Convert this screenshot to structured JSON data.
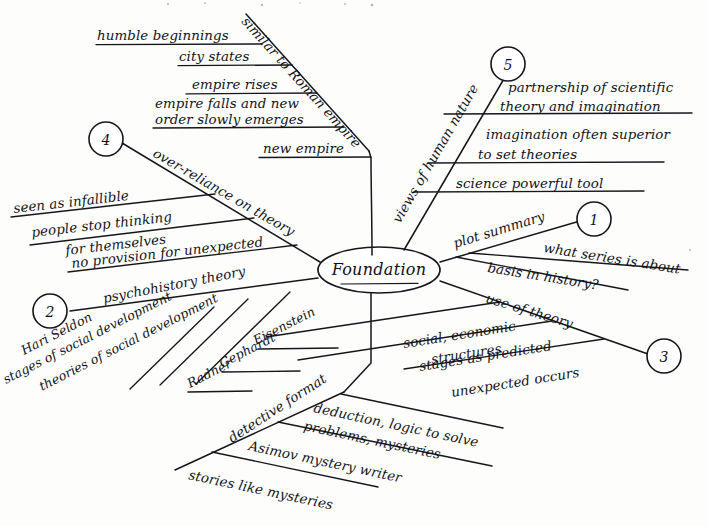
{
  "diagram": {
    "type": "mind-map",
    "title": "Foundation",
    "style": "hand-drawn cursive, black ink on white paper",
    "center": {
      "label": "Foundation",
      "shape": "ellipse"
    },
    "branch_count": 6,
    "numbered_markers": [
      "1",
      "2",
      "3",
      "4",
      "5"
    ],
    "colors": {
      "ink": "#15161a",
      "paper": "#fdfdfc"
    },
    "branches": [
      {
        "id": "roman-empire",
        "number": "",
        "label": "similar to Roman empire",
        "position": "top",
        "children": [
          {
            "lines": [
              "humble beginnings"
            ]
          },
          {
            "lines": [
              "city states"
            ]
          },
          {
            "lines": [
              "empire rises"
            ]
          },
          {
            "lines": [
              "empire falls and new",
              "order slowly emerges"
            ]
          },
          {
            "lines": [
              "new empire"
            ]
          }
        ]
      },
      {
        "id": "over-reliance-on-theory",
        "number": "4",
        "label": "over-reliance on theory",
        "position": "upper-left",
        "children": [
          {
            "lines": [
              "seen as infallible"
            ]
          },
          {
            "lines": [
              "people stop thinking",
              "for themselves"
            ]
          },
          {
            "lines": [
              "no provision for unexpected"
            ]
          }
        ]
      },
      {
        "id": "psychohistory-theory",
        "number": "2",
        "label": "psychohistory theory",
        "position": "lower-left",
        "children": [
          {
            "lines": [
              "Hari Seldon"
            ]
          },
          {
            "lines": [
              "stages of social development"
            ]
          },
          {
            "lines": [
              "theories of social development"
            ]
          },
          {
            "lines": [
              "Eisenstein"
            ]
          },
          {
            "lines": [
              "Gephardt"
            ]
          },
          {
            "lines": [
              "Radner"
            ]
          }
        ]
      },
      {
        "id": "detective-format",
        "number": "",
        "label": "detective format",
        "position": "bottom",
        "children": [
          {
            "lines": [
              "deduction, logic to solve",
              "problems, mysteries"
            ]
          },
          {
            "lines": [
              "Asimov mystery writer"
            ]
          },
          {
            "lines": [
              "stories like mysteries"
            ]
          }
        ]
      },
      {
        "id": "use-of-theory",
        "number": "3",
        "label": "use of theory",
        "position": "lower-right",
        "children": [
          {
            "lines": [
              "social, economic",
              "structures"
            ]
          },
          {
            "lines": [
              "stages as predicted"
            ]
          },
          {
            "lines": [
              "unexpected occurs"
            ]
          }
        ]
      },
      {
        "id": "plot-summary",
        "number": "1",
        "label": "plot summary",
        "position": "right",
        "children": [
          {
            "lines": [
              "what series is about"
            ]
          },
          {
            "lines": [
              "basis in history?"
            ]
          }
        ]
      },
      {
        "id": "views-of-human-nature",
        "number": "5",
        "label": "views of human nature",
        "position": "upper-right",
        "children": [
          {
            "lines": [
              "partnership of scientific",
              "theory and imagination"
            ]
          },
          {
            "lines": [
              "imagination often superior",
              "to set theories"
            ]
          },
          {
            "lines": [
              "science powerful tool"
            ]
          }
        ]
      }
    ]
  },
  "labels": {
    "center": "Foundation",
    "n1": "1",
    "n2": "2",
    "n3": "3",
    "n4": "4",
    "n5": "5",
    "b_roman": "similar to Roman empire",
    "b_roman_1": "humble beginnings",
    "b_roman_2": "city states",
    "b_roman_3": "empire rises",
    "b_roman_4a": "empire falls and new",
    "b_roman_4b": "order slowly emerges",
    "b_roman_5": "new empire",
    "b_over": "over-reliance on theory",
    "b_over_1": "seen as infallible",
    "b_over_2a": "people stop thinking",
    "b_over_2b": "for themselves",
    "b_over_3": "no provision for unexpected",
    "b_psy": "psychohistory theory",
    "b_psy_1": "Hari Seldon",
    "b_psy_2": "stages of social development",
    "b_psy_3": "theories of social development",
    "b_psy_4": "Eisenstein",
    "b_psy_5": "Gephardt",
    "b_psy_6": "Radner",
    "b_det": "detective format",
    "b_det_1a": "deduction, logic to solve",
    "b_det_1b": "problems, mysteries",
    "b_det_2": "Asimov mystery writer",
    "b_det_3": "stories like mysteries",
    "b_use": "use of theory",
    "b_use_1a": "social, economic",
    "b_use_1b": "structures",
    "b_use_2": "stages as predicted",
    "b_use_3": "unexpected occurs",
    "b_plot": "plot summary",
    "b_plot_1": "what series is about",
    "b_plot_2": "basis in history?",
    "b_views": "views of human nature",
    "b_views_1a": "partnership of scientific",
    "b_views_1b": "theory and imagination",
    "b_views_2a": "imagination often superior",
    "b_views_2b": "to set theories",
    "b_views_3": "science powerful tool"
  }
}
